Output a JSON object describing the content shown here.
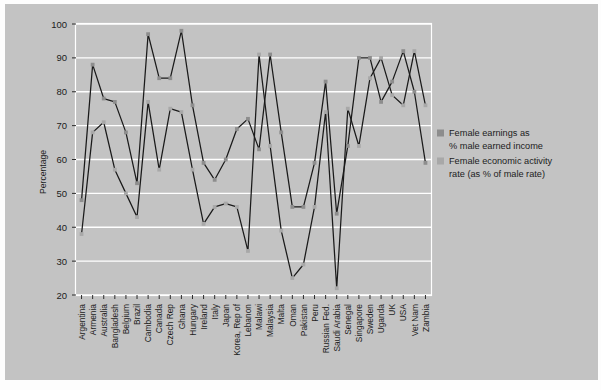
{
  "figure": {
    "background_color": "#c3c3c3",
    "page_border_color": "#fdfdfd",
    "plot_border_color": "#ffffff",
    "gridline_color": "#ffffff",
    "series_line_color": "#1a1a1a",
    "marker_color": "#8d8d8d"
  },
  "legend": {
    "position": "right",
    "entries": [
      {
        "marker_color": "#8d8d8d",
        "line1": "Female earnings as",
        "line2": "% male earned income"
      },
      {
        "marker_color": "#a8a8a8",
        "line1": "Female economic activity",
        "line2": "rate (as % of male rate)"
      }
    ]
  },
  "chart_data": {
    "type": "line",
    "title": "",
    "subtitle": "",
    "xlabel": "",
    "ylabel": "Percentage",
    "ylim": [
      20,
      100
    ],
    "yticks": [
      20,
      30,
      40,
      50,
      60,
      70,
      80,
      90,
      100
    ],
    "ytick_labels": [
      "20",
      "30",
      "40",
      "50",
      "60",
      "70",
      "80",
      "90",
      "100"
    ],
    "grid": true,
    "legend_position": "right",
    "categories": [
      "Argentina",
      "Armenia",
      "Australia",
      "Bangladesh",
      "Belgium",
      "Brazil",
      "Cambodia",
      "Canada",
      "Czech Rep",
      "Ghana",
      "Hungary",
      "Ireland",
      "Italy",
      "Japan",
      "Korea, Rep of",
      "Lebanon",
      "Malawi",
      "Malaysia",
      "Malta",
      "Oman",
      "Pakistan",
      "Peru",
      "Russian Fed.",
      "Saudi Arabia",
      "Senegal",
      "Singapore",
      "Sweden",
      "Uganda",
      "UK",
      "USA",
      "Vet Nam",
      "Zambia"
    ],
    "series": [
      {
        "name": "Female earnings as % male earned income",
        "marker_color": "#8d8d8d",
        "line_color": "#1a1a1a",
        "values": [
          48,
          88,
          78,
          77,
          68,
          53,
          97,
          84,
          84,
          98,
          76,
          59,
          54,
          60,
          69,
          72,
          63,
          91,
          68,
          46,
          46,
          59,
          83,
          44,
          64,
          90,
          90,
          77,
          83,
          92,
          80,
          59
        ]
      },
      {
        "name": "Female economic activity rate (as % of male rate)",
        "marker_color": "#a8a8a8",
        "line_color": "#1a1a1a",
        "values": [
          38,
          68,
          71,
          57,
          50,
          43,
          77,
          57,
          75,
          74,
          57,
          41,
          46,
          47,
          46,
          33,
          91,
          64,
          39,
          25,
          29,
          46,
          74,
          22,
          75,
          64,
          84,
          90,
          79,
          76,
          92,
          76
        ]
      }
    ]
  },
  "yaxis": {
    "label": "Percentage"
  }
}
